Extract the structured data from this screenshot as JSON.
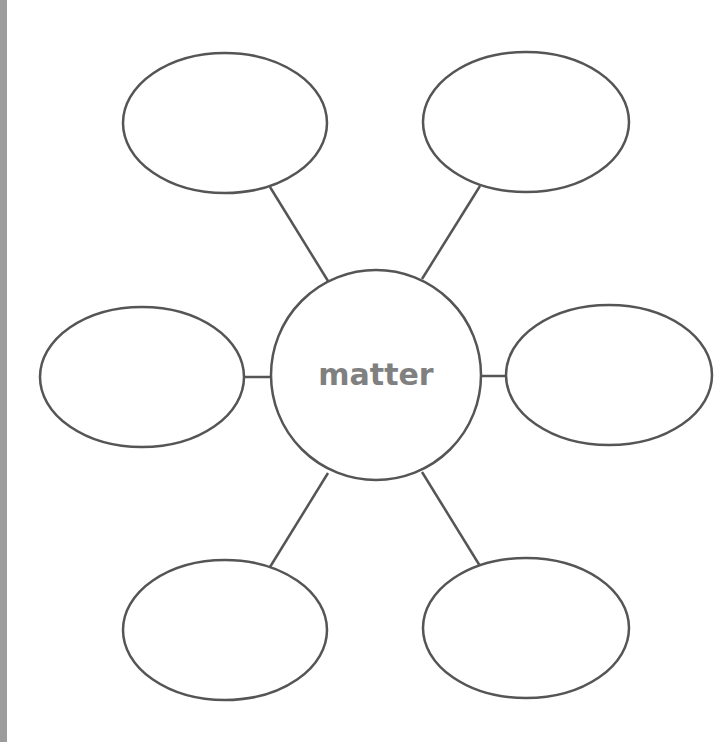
{
  "diagram": {
    "type": "bubble-map",
    "center": {
      "label": "matter",
      "cx": 376,
      "cy": 375,
      "r": 105
    },
    "stroke_color": "#555555",
    "text_color": "#808080",
    "strip_color": "#9c9c9c",
    "nodes": [
      {
        "id": "top-left",
        "label": "",
        "cx": 225,
        "cy": 123,
        "rx": 102,
        "ry": 70,
        "line": [
          270,
          187,
          328,
          281
        ]
      },
      {
        "id": "top-right",
        "label": "",
        "cx": 526,
        "cy": 122,
        "rx": 103,
        "ry": 70,
        "line": [
          480,
          186,
          422,
          279
        ]
      },
      {
        "id": "left",
        "label": "",
        "cx": 142,
        "cy": 377,
        "rx": 102,
        "ry": 70,
        "line": [
          244,
          377,
          271,
          377
        ]
      },
      {
        "id": "right",
        "label": "",
        "cx": 609,
        "cy": 375,
        "rx": 103,
        "ry": 70,
        "line": [
          481,
          376,
          506,
          376
        ]
      },
      {
        "id": "bottom-left",
        "label": "",
        "cx": 225,
        "cy": 630,
        "rx": 102,
        "ry": 70,
        "line": [
          328,
          473,
          270,
          567
        ]
      },
      {
        "id": "bottom-right",
        "label": "",
        "cx": 526,
        "cy": 628,
        "rx": 103,
        "ry": 70,
        "line": [
          422,
          472,
          480,
          566
        ]
      }
    ]
  }
}
